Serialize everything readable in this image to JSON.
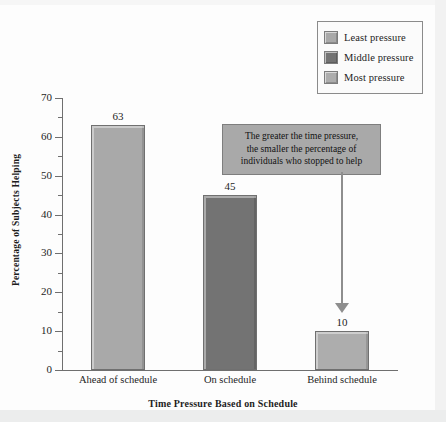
{
  "chart_data": {
    "type": "bar",
    "title": "",
    "categories": [
      "Ahead of schedule",
      "On schedule",
      "Behind schedule"
    ],
    "values": [
      63,
      45,
      10
    ],
    "bar_colors": [
      "#a9a9a9",
      "#737373",
      "#adadad"
    ],
    "xlabel": "Time Pressure Based on Schedule",
    "ylabel": "Percentage of Subjects Helping",
    "ylim": [
      0,
      70
    ],
    "ytick_labels": [
      "0",
      "10",
      "20",
      "30",
      "40",
      "50",
      "60",
      "70"
    ],
    "ytick_values": [
      0,
      10,
      20,
      30,
      40,
      50,
      60,
      70
    ],
    "yminor_values": [
      5,
      15,
      25,
      35,
      45,
      55,
      65
    ],
    "grid": false,
    "legend_position": "top-right",
    "legend": [
      {
        "label": "Least pressure",
        "color": "#a9a9a9"
      },
      {
        "label": "Middle pressure",
        "color": "#737373"
      },
      {
        "label": "Most pressure",
        "color": "#adadad"
      }
    ],
    "annotations": [
      {
        "text": "The greater the time pressure, the smaller the percentage of individuals who stopped to help",
        "line1": "The greater the time pressure,",
        "line2": "the smaller the percentage of",
        "line3": "individuals who stopped to help",
        "background": "#a9a9a9",
        "points_to": "Behind schedule"
      }
    ],
    "data_labels": [
      "63",
      "45",
      "10"
    ]
  },
  "colors": {
    "axis": "#6f6f6f",
    "text": "#1d1d1d",
    "background": "#fdfdfd",
    "annotation_fill": "#a9a9a9",
    "arrow": "#8e8e8e"
  }
}
